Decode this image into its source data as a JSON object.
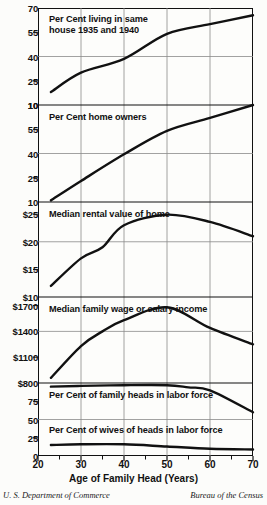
{
  "figure": {
    "xaxis_title": "Age of Family Head (Years)",
    "credit_left": "U. S. Department of Commerce",
    "credit_right": "Bureau of the Census",
    "line_color": "#111111",
    "grid_color": "#8a8a8a",
    "frame_color": "#111111"
  },
  "xaxis": {
    "min": 20,
    "max": 70,
    "tick_labels": [
      "20",
      "30",
      "40",
      "50",
      "60",
      "70"
    ],
    "tick_values": [
      20,
      30,
      40,
      50,
      60,
      70
    ],
    "minor_ticks": [
      25,
      35,
      45,
      55,
      65
    ],
    "gridlines": [
      30,
      40,
      50,
      60
    ]
  },
  "panels": [
    {
      "label": "Per Cent living in same",
      "label2": "house 1935 and 1940",
      "ticks": [
        "70",
        "55",
        "40",
        "25",
        "10"
      ],
      "tick_values": [
        70,
        55,
        40,
        25,
        10
      ],
      "gridlines": [
        40
      ],
      "minor": [
        55,
        25
      ]
    },
    {
      "label": "Per Cent home owners",
      "ticks": [
        "10",
        "55",
        "40",
        "25",
        "10"
      ],
      "tick_values": [
        70,
        55,
        40,
        25,
        10
      ],
      "gridlines": [
        40
      ],
      "minor": [
        55,
        25
      ]
    },
    {
      "label": "Median rental value of home",
      "ticks": [
        "$25",
        "$20",
        "$15",
        "$10"
      ],
      "tick_values": [
        25,
        20,
        15,
        10
      ],
      "gridlines": [
        20
      ],
      "minor": [
        25,
        15
      ]
    },
    {
      "label": "Median family wage or salary income",
      "ticks": [
        "$1700",
        "$1400",
        "$1100",
        "$800"
      ],
      "tick_values": [
        1700,
        1400,
        1100,
        800
      ],
      "gridlines": [
        1400
      ],
      "minor": [
        1700,
        1100
      ]
    },
    {
      "label": "Per Cent of family heads in labor force",
      "ticks": [
        "75",
        "50"
      ],
      "tick_values": [
        75,
        50
      ],
      "gridlines": [
        50
      ],
      "minor": [
        75
      ]
    },
    {
      "label": "Per Cent of wives of heads in labor force",
      "ticks": [
        "25",
        "0"
      ],
      "tick_values": [
        25,
        0
      ],
      "gridlines": [],
      "minor": [
        25
      ]
    }
  ],
  "chart_data": [
    {
      "type": "line",
      "title": "Per Cent living in same house 1935 and 1940",
      "xlabel": "Age of Family Head (Years)",
      "ylabel": "Per Cent",
      "xlim": [
        20,
        70
      ],
      "ylim": [
        10,
        70
      ],
      "yticks": [
        10,
        25,
        40,
        55,
        70
      ],
      "x": [
        23,
        30,
        40,
        50,
        60,
        70
      ],
      "values": [
        18,
        30,
        38.5,
        54,
        60,
        65.5
      ],
      "grid": true,
      "legend": "none"
    },
    {
      "type": "line",
      "title": "Per Cent home owners",
      "xlabel": "Age of Family Head (Years)",
      "ylabel": "Per Cent",
      "xlim": [
        20,
        70
      ],
      "ylim": [
        10,
        70
      ],
      "yticks": [
        10,
        25,
        40,
        55,
        70
      ],
      "x": [
        23,
        30,
        40,
        50,
        60,
        70
      ],
      "values": [
        11,
        23,
        39.5,
        54,
        62,
        70
      ],
      "grid": true,
      "legend": "none"
    },
    {
      "type": "line",
      "title": "Median rental value of home",
      "xlabel": "Age of Family Head (Years)",
      "ylabel": "Dollars per month",
      "xlim": [
        20,
        70
      ],
      "ylim": [
        10,
        27
      ],
      "yticks": [
        10,
        15,
        20,
        25
      ],
      "x": [
        23,
        30,
        35,
        40,
        50,
        60,
        70
      ],
      "values": [
        12,
        17,
        19,
        23,
        24.9,
        23.6,
        21
      ],
      "grid": true,
      "legend": "none"
    },
    {
      "type": "line",
      "title": "Median family wage or salary income",
      "xlabel": "Age of Family Head (Years)",
      "ylabel": "Dollars",
      "xlim": [
        20,
        70
      ],
      "ylim": [
        800,
        1800
      ],
      "yticks": [
        800,
        1100,
        1400,
        1700
      ],
      "x": [
        23,
        30,
        35,
        40,
        50,
        60,
        70
      ],
      "values": [
        860,
        1230,
        1400,
        1530,
        1680,
        1440,
        1250
      ],
      "grid": true,
      "legend": "none"
    },
    {
      "type": "line",
      "title": "Per Cent of family heads in labor force",
      "xlabel": "Age of Family Head (Years)",
      "ylabel": "Per Cent",
      "xlim": [
        20,
        70
      ],
      "ylim": [
        0,
        100
      ],
      "yticks": [
        0,
        25,
        50,
        75
      ],
      "x": [
        23,
        30,
        40,
        50,
        55,
        60,
        70
      ],
      "values": [
        95,
        96,
        97,
        97,
        94,
        90,
        60
      ],
      "grid": true,
      "legend": "none"
    },
    {
      "type": "line",
      "title": "Per Cent of wives of heads in labor force",
      "xlabel": "Age of Family Head (Years)",
      "ylabel": "Per Cent",
      "xlim": [
        20,
        70
      ],
      "ylim": [
        0,
        100
      ],
      "yticks": [
        0,
        25,
        50,
        75
      ],
      "x": [
        23,
        30,
        40,
        50,
        60,
        70
      ],
      "values": [
        15,
        16,
        16,
        13,
        10,
        9
      ],
      "grid": true,
      "legend": "none"
    }
  ]
}
